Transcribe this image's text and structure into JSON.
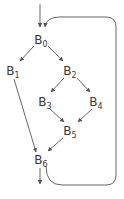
{
  "diagram": {
    "type": "control-flow-graph",
    "colors": {
      "edge": "#555555",
      "text": "#3a3a3a",
      "background": "#ffffff"
    },
    "nodes": [
      {
        "id": "B0",
        "base": "B",
        "sub": "0",
        "x": 41,
        "y": 40
      },
      {
        "id": "B1",
        "base": "B",
        "sub": "1",
        "x": 13,
        "y": 71
      },
      {
        "id": "B2",
        "base": "B",
        "sub": "2",
        "x": 70,
        "y": 71
      },
      {
        "id": "B3",
        "base": "B",
        "sub": "3",
        "x": 45,
        "y": 102
      },
      {
        "id": "B4",
        "base": "B",
        "sub": "4",
        "x": 96,
        "y": 102
      },
      {
        "id": "B5",
        "base": "B",
        "sub": "5",
        "x": 70,
        "y": 131
      },
      {
        "id": "B6",
        "base": "B",
        "sub": "6",
        "x": 41,
        "y": 160
      }
    ],
    "edges": [
      {
        "from": "entry",
        "to": "B0"
      },
      {
        "from": "B0",
        "to": "B1"
      },
      {
        "from": "B0",
        "to": "B2"
      },
      {
        "from": "B2",
        "to": "B3"
      },
      {
        "from": "B2",
        "to": "B4"
      },
      {
        "from": "B3",
        "to": "B5"
      },
      {
        "from": "B4",
        "to": "B5"
      },
      {
        "from": "B1",
        "to": "B6"
      },
      {
        "from": "B5",
        "to": "B6"
      },
      {
        "from": "B6",
        "to": "exit"
      },
      {
        "from": "B6",
        "to": "B0",
        "kind": "back-edge-loop"
      }
    ]
  }
}
